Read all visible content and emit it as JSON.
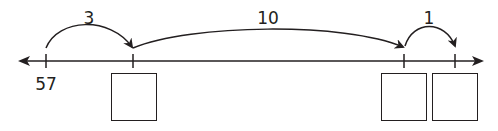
{
  "diagram": {
    "type": "open number line",
    "start_label": "57",
    "jumps": [
      {
        "label": "3",
        "from_tick": 0,
        "to_tick": 1
      },
      {
        "label": "10",
        "from_tick": 1,
        "to_tick": 2
      },
      {
        "label": "1",
        "from_tick": 2,
        "to_tick": 3
      }
    ],
    "answer_boxes": [
      {
        "under_tick": 1,
        "value": ""
      },
      {
        "under_tick": 2,
        "value": ""
      },
      {
        "under_tick": 3,
        "value": ""
      }
    ],
    "colors": {
      "stroke": "#231f20",
      "background": "#ffffff"
    }
  }
}
